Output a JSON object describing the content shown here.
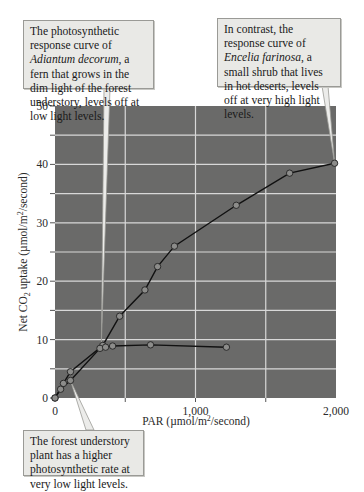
{
  "chart_data": {
    "type": "line",
    "title": "",
    "xlabel": "PAR (µmol/m²/second)",
    "ylabel": "Net CO₂ uptake (µmol/m²/second)",
    "xlim": [
      0,
      2000
    ],
    "ylim": [
      0,
      50
    ],
    "x_ticks": [
      "0",
      "1,000",
      "2,000"
    ],
    "y_ticks": [
      "0",
      "10",
      "20",
      "30",
      "40",
      "50"
    ],
    "grid": true,
    "legend": null,
    "series": [
      {
        "name": "Encelia farinosa (desert shrub)",
        "x": [
          0,
          60,
          110,
          340,
          460,
          640,
          730,
          850,
          1290,
          1670,
          1990
        ],
        "y": [
          0,
          2.5,
          4.5,
          9.0,
          14,
          18.5,
          22.5,
          26,
          33,
          38.5,
          40.2
        ]
      },
      {
        "name": "Adiantum decorum (forest understory fern)",
        "x": [
          0,
          40,
          110,
          320,
          360,
          410,
          680,
          1220
        ],
        "y": [
          0,
          1.5,
          3.0,
          8.5,
          8.7,
          8.9,
          9.1,
          8.7
        ]
      }
    ],
    "annotations": [
      {
        "text_plain": "The photosynthetic response curve of Adiantum decorum, a fern that grows in the dim light of the forest understory, levels off at low light levels.",
        "target": "Adiantum decorum curve"
      },
      {
        "text_plain": "In contrast, the response curve of Encelia farinosa, a small shrub that lives in hot deserts, levels off at very high light levels.",
        "target": "Encelia farinosa curve at 2,000"
      },
      {
        "text_plain": "The forest understory plant has a higher photosynthetic rate at very low light levels.",
        "target": "low-light region near origin"
      }
    ]
  },
  "callouts": {
    "fern": {
      "pre": "The photosynthetic response curve of ",
      "species": "Adiantum decorum",
      "post": ", a fern that grows in the dim light of the forest understory, levels off at low light levels."
    },
    "shrub": {
      "pre": "In contrast, the response curve of ",
      "species": "Encelia farinosa",
      "post": ", a small shrub that lives in hot deserts, levels off at very high light levels."
    },
    "understory": {
      "text": "The forest understory plant has a higher photosynthetic rate at very low light levels."
    }
  },
  "axes": {
    "x_label_pre": "PAR (µmol/m",
    "x_label_sup": "2",
    "x_label_post": "/second)",
    "y_label_pre": "Net CO",
    "y_label_sub": "2",
    "y_label_mid": " uptake (µmol/m",
    "y_label_sup": "2",
    "y_label_post": "/second)",
    "x_ticks": [
      "0",
      "1,000",
      "2,000"
    ],
    "y_ticks": [
      "0",
      "10",
      "20",
      "30",
      "40",
      "50"
    ]
  },
  "colors": {
    "plot_bg": "#6a6a69",
    "grid": "#d8d8d8",
    "line": "#111111",
    "marker_fill": "#8c8c8a",
    "callout_bg": "#e9e9e6"
  }
}
